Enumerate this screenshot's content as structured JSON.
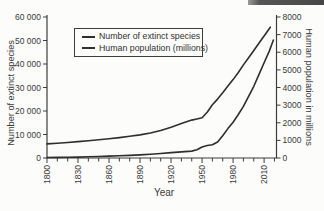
{
  "decor": {
    "top_right_bar_color": "#474747"
  },
  "chart_data": {
    "type": "line",
    "title": "",
    "grid": false,
    "legend": {
      "position": "top-left-inside",
      "entries": [
        "Number of extinct species",
        "Human population (millions)"
      ]
    },
    "x_axis": {
      "label": "Year",
      "range": [
        1800,
        2022
      ],
      "major_ticks": [
        1800,
        1830,
        1860,
        1890,
        1920,
        1950,
        1980,
        2010
      ],
      "minor_tick_step": 10,
      "minor_tick_end": 2020
    },
    "y_axis_left": {
      "label": "Number of extinct species",
      "range": [
        0,
        60000
      ],
      "ticks": [
        {
          "value": 0,
          "label": "0"
        },
        {
          "value": 10000,
          "label": "10 000"
        },
        {
          "value": 20000,
          "label": "20 000"
        },
        {
          "value": 30000,
          "label": "30 000"
        },
        {
          "value": 40000,
          "label": "40 000"
        },
        {
          "value": 50000,
          "label": "50 000"
        },
        {
          "value": 60000,
          "label": "60 000"
        }
      ]
    },
    "y_axis_right": {
      "label": "Human population in millions",
      "range": [
        0,
        8000
      ],
      "ticks": [
        {
          "value": 0,
          "label": "0"
        },
        {
          "value": 1000,
          "label": "1000"
        },
        {
          "value": 2000,
          "label": "2000"
        },
        {
          "value": 3000,
          "label": "3000"
        },
        {
          "value": 4000,
          "label": "4000"
        },
        {
          "value": 5000,
          "label": "5000"
        },
        {
          "value": 6000,
          "label": "6000"
        },
        {
          "value": 7000,
          "label": "7000"
        },
        {
          "value": 8000,
          "label": "8000"
        }
      ]
    },
    "series": [
      {
        "name": "Number of extinct species",
        "axis": "left",
        "color": "#2e2e2e",
        "points": [
          [
            1800,
            200
          ],
          [
            1810,
            260
          ],
          [
            1820,
            330
          ],
          [
            1830,
            400
          ],
          [
            1840,
            520
          ],
          [
            1850,
            650
          ],
          [
            1860,
            800
          ],
          [
            1870,
            950
          ],
          [
            1880,
            1100
          ],
          [
            1890,
            1300
          ],
          [
            1900,
            1600
          ],
          [
            1910,
            1900
          ],
          [
            1920,
            2300
          ],
          [
            1930,
            2600
          ],
          [
            1940,
            2950
          ],
          [
            1945,
            3500
          ],
          [
            1950,
            4700
          ],
          [
            1955,
            5300
          ],
          [
            1960,
            5600
          ],
          [
            1965,
            6800
          ],
          [
            1970,
            9500
          ],
          [
            1975,
            12500
          ],
          [
            1980,
            15200
          ],
          [
            1985,
            18500
          ],
          [
            1990,
            22000
          ],
          [
            1995,
            26200
          ],
          [
            2000,
            30500
          ],
          [
            2005,
            35500
          ],
          [
            2010,
            40500
          ],
          [
            2015,
            45500
          ],
          [
            2019,
            50200
          ]
        ]
      },
      {
        "name": "Human population (millions)",
        "axis": "right",
        "color": "#2e2e2e",
        "points": [
          [
            1800,
            800
          ],
          [
            1810,
            840
          ],
          [
            1820,
            880
          ],
          [
            1830,
            930
          ],
          [
            1840,
            980
          ],
          [
            1850,
            1030
          ],
          [
            1860,
            1090
          ],
          [
            1870,
            1160
          ],
          [
            1880,
            1230
          ],
          [
            1890,
            1310
          ],
          [
            1900,
            1420
          ],
          [
            1910,
            1560
          ],
          [
            1920,
            1750
          ],
          [
            1930,
            1950
          ],
          [
            1940,
            2150
          ],
          [
            1945,
            2210
          ],
          [
            1950,
            2280
          ],
          [
            1955,
            2600
          ],
          [
            1960,
            3020
          ],
          [
            1965,
            3340
          ],
          [
            1970,
            3700
          ],
          [
            1975,
            4080
          ],
          [
            1980,
            4450
          ],
          [
            1985,
            4850
          ],
          [
            1990,
            5280
          ],
          [
            1995,
            5690
          ],
          [
            2000,
            6100
          ],
          [
            2005,
            6510
          ],
          [
            2010,
            6920
          ],
          [
            2016,
            7420
          ]
        ]
      }
    ]
  }
}
